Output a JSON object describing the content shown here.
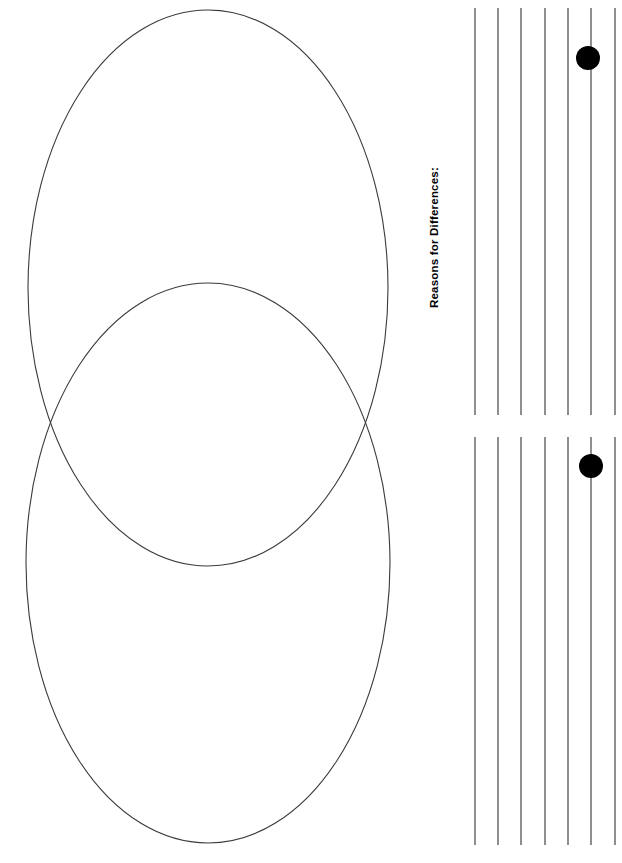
{
  "page": {
    "width": 622,
    "height": 863,
    "background_color": "#ffffff",
    "ink_color": "#333333",
    "dot_color": "#000000"
  },
  "venn": {
    "name": "venn-diagram",
    "stroke_color": "#3a3a3a",
    "stroke_width": 1.1,
    "fill": "none",
    "ellipses": [
      {
        "label": "upper-circle",
        "cx": 208,
        "cy": 288,
        "rx": 180,
        "ry": 278
      },
      {
        "label": "lower-circle",
        "cx": 208,
        "cy": 563,
        "rx": 182,
        "ry": 280
      }
    ],
    "intersection_points": [
      {
        "x": 50,
        "y": 424
      },
      {
        "x": 373,
        "y": 432
      }
    ]
  },
  "notes": {
    "sections": [
      {
        "id": "differences",
        "label": "Reasons for Differences:",
        "line_count": 7,
        "line_x_positions": [
          55,
          78,
          101,
          125,
          148,
          171,
          195
        ],
        "line_top": 8,
        "line_bottom": 415,
        "marker": {
          "name": "bullet-dot",
          "x": 168,
          "y": 58,
          "radius": 12
        }
      },
      {
        "id": "similarities",
        "label": "Reasons for Similarities:",
        "line_count": 7,
        "line_x_positions": [
          55,
          78,
          101,
          125,
          148,
          171,
          195
        ],
        "line_top": 7,
        "line_bottom": 415,
        "marker": {
          "name": "bullet-dot",
          "x": 171,
          "y": 36,
          "radius": 12
        }
      }
    ]
  }
}
